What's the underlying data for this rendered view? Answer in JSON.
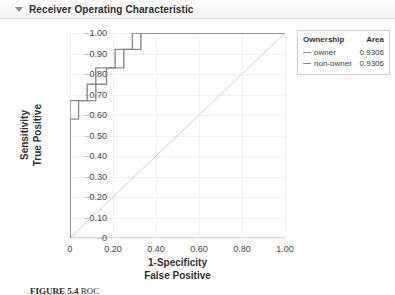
{
  "panel": {
    "title": "Receiver Operating Characteristic",
    "disclosure_icon": "triangle-down-icon",
    "expanded": true
  },
  "legend": {
    "headers": [
      "Ownership",
      "Area"
    ],
    "rows": [
      {
        "label": "owner",
        "area": "0.9306",
        "color": "#8a8a8a"
      },
      {
        "label": "non-owner",
        "area": "0.9306",
        "color": "#8a8a8a"
      }
    ]
  },
  "caption": {
    "figure_label": "FIGURE 5.4",
    "text": "ROC"
  },
  "chart_data": {
    "type": "line",
    "title": "Receiver Operating Characteristic",
    "xlabel": "1-Specificity",
    "xlabel2": "False Positive",
    "ylabel": "Sensitivity",
    "ylabel2": "True Positive",
    "xlim": [
      0,
      1
    ],
    "ylim": [
      0,
      1
    ],
    "grid": true,
    "legend_position": "right-outside",
    "xticks": [
      "0",
      "0.20",
      "0.40",
      "0.60",
      "0.80",
      "1.00"
    ],
    "xtick_values": [
      0,
      0.2,
      0.4,
      0.6,
      0.8,
      1.0
    ],
    "yticks": [
      "0",
      "0.10",
      "0.20",
      "0.30",
      "0.40",
      "0.50",
      "0.60",
      "0.70",
      "0.80",
      "0.90",
      "1.00"
    ],
    "ytick_values": [
      0,
      0.1,
      0.2,
      0.3,
      0.4,
      0.5,
      0.6,
      0.7,
      0.8,
      0.9,
      1.0
    ],
    "series": [
      {
        "name": "owner",
        "area": 0.9306,
        "color": "#8a8a8a",
        "points": [
          [
            0.0,
            0.0
          ],
          [
            0.0,
            0.58
          ],
          [
            0.04,
            0.58
          ],
          [
            0.04,
            0.67
          ],
          [
            0.12,
            0.67
          ],
          [
            0.12,
            0.75
          ],
          [
            0.17,
            0.75
          ],
          [
            0.17,
            0.83
          ],
          [
            0.25,
            0.83
          ],
          [
            0.25,
            0.92
          ],
          [
            0.33,
            0.92
          ],
          [
            0.33,
            1.0
          ],
          [
            1.0,
            1.0
          ]
        ]
      },
      {
        "name": "non-owner",
        "area": 0.9306,
        "color": "#8a8a8a",
        "points": [
          [
            0.0,
            0.0
          ],
          [
            0.0,
            0.67
          ],
          [
            0.08,
            0.67
          ],
          [
            0.08,
            0.75
          ],
          [
            0.12,
            0.75
          ],
          [
            0.12,
            0.83
          ],
          [
            0.21,
            0.83
          ],
          [
            0.21,
            0.92
          ],
          [
            0.29,
            0.92
          ],
          [
            0.29,
            1.0
          ],
          [
            0.38,
            1.0
          ],
          [
            1.0,
            1.0
          ]
        ]
      }
    ],
    "reference_line": {
      "name": "chance-diagonal",
      "color": "#c9c9c9",
      "points": [
        [
          0.0,
          0.0
        ],
        [
          1.0,
          1.0
        ]
      ]
    }
  }
}
